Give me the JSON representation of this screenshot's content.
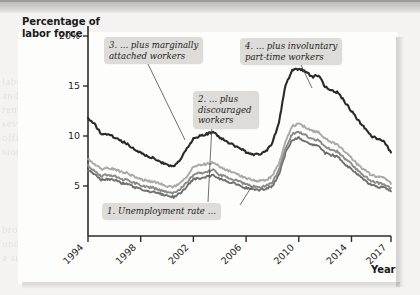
{
  "figure": {
    "y_axis_title": "Percentage of\nlabor force",
    "x_axis_title": "Year"
  },
  "callouts": [
    {
      "id": "callout-1",
      "text": "1. Unemployment rate ..."
    },
    {
      "id": "callout-2",
      "text": "2. ... plus\ndiscouraged\nworkers"
    },
    {
      "id": "callout-3",
      "text": "3. ... plus marginally\nattached workers"
    },
    {
      "id": "callout-4",
      "text": "4. ... plus involuntary\npart-time workers"
    }
  ],
  "colors": {
    "series_1": "#8a8a8a",
    "series_2": "#6f6f6f",
    "series_3": "#a9a9a9",
    "series_4": "#2a2a2a",
    "callout_bg": "#dedcd8",
    "axis": "#2b2b2b",
    "plot_bg": "#fdfdfc"
  },
  "chart_data": {
    "type": "line",
    "title": "",
    "xlabel": "Year",
    "ylabel": "Percentage of labor force",
    "xlim": [
      1994,
      2017
    ],
    "ylim": [
      0,
      21
    ],
    "yticks": [
      5,
      10,
      15,
      20
    ],
    "ytick_labels": [
      "5",
      "10",
      "15",
      "20%"
    ],
    "xticks": [
      1994,
      1998,
      2002,
      2006,
      2010,
      2014,
      2017
    ],
    "xtick_labels": [
      "1994",
      "1998",
      "2002",
      "2006",
      "2010",
      "2014",
      "2017"
    ],
    "grid": false,
    "legend": "annotations-as-callouts",
    "x": [
      1994.0,
      1994.5,
      1995.0,
      1995.5,
      1996.0,
      1996.5,
      1997.0,
      1997.5,
      1998.0,
      1998.5,
      1999.0,
      1999.5,
      2000.0,
      2000.5,
      2001.0,
      2001.5,
      2002.0,
      2002.5,
      2003.0,
      2003.5,
      2004.0,
      2004.5,
      2005.0,
      2005.5,
      2006.0,
      2006.5,
      2007.0,
      2007.5,
      2008.0,
      2008.5,
      2009.0,
      2009.5,
      2010.0,
      2010.5,
      2011.0,
      2011.5,
      2012.0,
      2012.5,
      2013.0,
      2013.5,
      2014.0,
      2014.5,
      2015.0,
      2015.5,
      2016.0,
      2016.5,
      2017.0
    ],
    "series": [
      {
        "name": "1. Unemployment rate (U-3)",
        "color": "#6f6f6f",
        "values": [
          6.6,
          6.1,
          5.6,
          5.7,
          5.6,
          5.3,
          5.2,
          4.9,
          4.7,
          4.5,
          4.4,
          4.2,
          4.0,
          3.9,
          4.3,
          4.9,
          5.7,
          5.8,
          5.9,
          6.1,
          5.7,
          5.5,
          5.3,
          5.0,
          4.8,
          4.6,
          4.6,
          4.7,
          5.0,
          6.2,
          8.3,
          9.6,
          9.8,
          9.5,
          9.1,
          9.0,
          8.3,
          8.1,
          7.9,
          7.2,
          6.7,
          6.1,
          5.6,
          5.1,
          4.9,
          4.9,
          4.4
        ],
        "label_value": 4.4
      },
      {
        "name": "2. ... plus discouraged workers",
        "color": "#8a8a8a",
        "values": [
          7.0,
          6.5,
          6.0,
          6.1,
          6.0,
          5.7,
          5.6,
          5.3,
          5.1,
          4.9,
          4.8,
          4.6,
          4.4,
          4.3,
          4.7,
          5.3,
          6.1,
          6.3,
          6.4,
          6.6,
          6.1,
          5.9,
          5.7,
          5.4,
          5.2,
          5.0,
          4.9,
          5.0,
          5.4,
          6.6,
          8.8,
          10.2,
          10.4,
          10.1,
          9.7,
          9.6,
          8.9,
          8.6,
          8.4,
          7.7,
          7.2,
          6.5,
          6.0,
          5.5,
          5.3,
          5.2,
          4.7
        ],
        "label_value": 4.7
      },
      {
        "name": "3. ... plus marginally attached workers",
        "color": "#a9a9a9",
        "values": [
          7.7,
          7.2,
          6.7,
          6.8,
          6.7,
          6.4,
          6.3,
          5.9,
          5.7,
          5.5,
          5.4,
          5.2,
          5.0,
          4.9,
          5.3,
          6.0,
          6.9,
          7.1,
          7.2,
          7.4,
          6.9,
          6.6,
          6.4,
          6.1,
          5.8,
          5.6,
          5.5,
          5.6,
          6.0,
          7.3,
          9.5,
          11.0,
          11.2,
          10.9,
          10.5,
          10.4,
          9.7,
          9.4,
          9.1,
          8.4,
          7.8,
          7.1,
          6.6,
          6.1,
          5.9,
          5.8,
          5.3
        ],
        "label_value": 5.3
      },
      {
        "name": "4. ... plus involuntary part-time workers (U-6)",
        "color": "#2a2a2a",
        "values": [
          11.8,
          11.2,
          10.2,
          10.1,
          9.9,
          9.5,
          9.2,
          8.7,
          8.3,
          8.0,
          7.8,
          7.4,
          7.1,
          6.9,
          7.6,
          8.7,
          9.7,
          10.0,
          10.2,
          10.4,
          9.8,
          9.5,
          9.1,
          8.8,
          8.4,
          8.1,
          8.2,
          8.5,
          9.3,
          11.4,
          15.1,
          16.6,
          16.7,
          16.5,
          15.9,
          16.1,
          14.9,
          14.6,
          14.3,
          13.4,
          12.5,
          11.6,
          10.8,
          10.0,
          9.7,
          9.4,
          8.3
        ],
        "label_value": 8.3
      }
    ]
  },
  "bleed_text": [
    "labor force participation",
    "and employment rates",
    "remained depressed for",
    "several years after the",
    "official end of the reces-",
    "sion in mid-2009. The",
    "broader measures of",
    "underemployment tell",
    "a similar story about",
    "the slow recovery."
  ]
}
